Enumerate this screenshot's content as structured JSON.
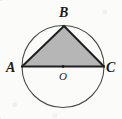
{
  "figure": {
    "kind": "geometry-diagram",
    "width": 122,
    "height": 119,
    "background_color": "#fbfbfa"
  },
  "colors": {
    "background": "#fbfbfa",
    "circle_stroke": "#4a4a4a",
    "chord_stroke": "#1f1f1f",
    "triangle_fill": "#b6b6b6",
    "label_color": "#1b1b1b",
    "center_dot": "#1f1f1f"
  },
  "circle": {
    "name": "circle-O",
    "center_x": 63,
    "center_y": 66.5,
    "radius": 41,
    "stroke_width": 1.1
  },
  "points": {
    "A": {
      "label": "A",
      "x": 22,
      "y": 66.5
    },
    "B": {
      "label": "B",
      "x": 64,
      "y": 26
    },
    "C": {
      "label": "C",
      "x": 104,
      "y": 66.5
    },
    "O": {
      "label": "O",
      "x": 63,
      "y": 66.5
    }
  },
  "segments": [
    {
      "name": "segment-AB",
      "from": "A",
      "to": "B",
      "stroke_width": 2.0
    },
    {
      "name": "segment-BC",
      "from": "B",
      "to": "C",
      "stroke_width": 2.0
    },
    {
      "name": "segment-AC",
      "from": "A",
      "to": "C",
      "stroke_width": 2.0,
      "note": "diameter through O"
    }
  ],
  "shaded_region": {
    "name": "triangle-ABC",
    "vertices": [
      "A",
      "B",
      "C"
    ],
    "fill": "#b6b6b6",
    "polygon_points": "22,66.5 64,26 104,66.5"
  },
  "labels": {
    "A": "A",
    "B": "B",
    "C": "C",
    "O": "O"
  }
}
